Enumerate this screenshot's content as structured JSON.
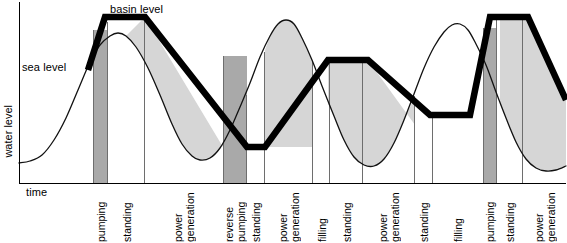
{
  "figure": {
    "title": "",
    "axis": {
      "y_label": "water level",
      "x_label": "time",
      "origin_x": 19,
      "origin_y": 183,
      "right_x": 566,
      "top_y": 2
    },
    "annotations": [
      {
        "name": "sea-level-label",
        "text": "sea level",
        "x": 22,
        "y": 61
      },
      {
        "name": "basin-level-label",
        "text": "basin level",
        "x": 110,
        "y": 4
      }
    ],
    "colors": {
      "basin_line": "#000000",
      "sea_line": "#1a1a1a",
      "fill_light": "#d4d4d4",
      "fill_dark": "#a8a8a8",
      "axis": "#000000",
      "divider": "#6e6e6e",
      "background": "#ffffff"
    },
    "phases": [
      {
        "label": "pumping",
        "x0": 93,
        "x1": 108,
        "shade": "dark"
      },
      {
        "label": "standing",
        "x0": 108,
        "x1": 145,
        "shade": "none"
      },
      {
        "label": "power\ngeneration",
        "x0": 145,
        "x1": 223,
        "shade": "none"
      },
      {
        "label": "reverse\npumping",
        "x0": 223,
        "x1": 247,
        "shade": "dark"
      },
      {
        "label": "standing",
        "x0": 247,
        "x1": 265,
        "shade": "none"
      },
      {
        "label": "power\ngeneration",
        "x0": 265,
        "x1": 313,
        "shade": "none"
      },
      {
        "label": "filling",
        "x0": 313,
        "x1": 330,
        "shade": "none"
      },
      {
        "label": "standing",
        "x0": 330,
        "x1": 363,
        "shade": "none"
      },
      {
        "label": "power\ngeneration",
        "x0": 363,
        "x1": 415,
        "shade": "none"
      },
      {
        "label": "standing",
        "x0": 415,
        "x1": 433,
        "shade": "none"
      },
      {
        "label": "filling",
        "x0": 433,
        "x1": 483,
        "shade": "none"
      },
      {
        "label": "pumping",
        "x0": 483,
        "x1": 497,
        "shade": "dark"
      },
      {
        "label": "standing",
        "x0": 497,
        "x1": 523,
        "shade": "none"
      },
      {
        "label": "power\ngeneration",
        "x0": 523,
        "x1": 566,
        "shade": "none"
      }
    ]
  },
  "chart_data": {
    "type": "line",
    "xlabel": "time",
    "ylabel": "water level",
    "axis_ticks": {
      "x": [],
      "y": []
    },
    "grid": false,
    "legend": [
      "sea level",
      "basin level"
    ],
    "legend_position": "inline-annotation",
    "series": [
      {
        "name": "sea level",
        "style": "thin-curve",
        "points": [
          [
            19,
            163
          ],
          [
            30,
            161
          ],
          [
            42,
            155
          ],
          [
            54,
            140
          ],
          [
            66,
            118
          ],
          [
            78,
            90
          ],
          [
            90,
            62
          ],
          [
            100,
            45
          ],
          [
            110,
            36
          ],
          [
            118,
            33
          ],
          [
            126,
            36
          ],
          [
            136,
            47
          ],
          [
            148,
            68
          ],
          [
            160,
            95
          ],
          [
            172,
            124
          ],
          [
            182,
            144
          ],
          [
            192,
            156
          ],
          [
            200,
            160
          ],
          [
            210,
            158
          ],
          [
            220,
            148
          ],
          [
            230,
            130
          ],
          [
            240,
            107
          ],
          [
            250,
            83
          ],
          [
            260,
            57
          ],
          [
            270,
            36
          ],
          [
            278,
            24
          ],
          [
            286,
            20
          ],
          [
            294,
            24
          ],
          [
            302,
            38
          ],
          [
            312,
            60
          ],
          [
            322,
            86
          ],
          [
            334,
            116
          ],
          [
            344,
            140
          ],
          [
            354,
            157
          ],
          [
            364,
            165
          ],
          [
            374,
            166
          ],
          [
            384,
            159
          ],
          [
            394,
            143
          ],
          [
            404,
            120
          ],
          [
            414,
            94
          ],
          [
            424,
            68
          ],
          [
            434,
            47
          ],
          [
            444,
            32
          ],
          [
            452,
            25
          ],
          [
            460,
            24
          ],
          [
            468,
            30
          ],
          [
            476,
            44
          ],
          [
            486,
            65
          ],
          [
            496,
            92
          ],
          [
            506,
            118
          ],
          [
            516,
            142
          ],
          [
            526,
            159
          ],
          [
            536,
            168
          ],
          [
            546,
            171
          ],
          [
            556,
            170
          ],
          [
            566,
            166
          ]
        ]
      },
      {
        "name": "basin level",
        "style": "thick-line",
        "points": [
          [
            88,
            70
          ],
          [
            105,
            17
          ],
          [
            145,
            17
          ],
          [
            247,
            147
          ],
          [
            265,
            147
          ],
          [
            328,
            60
          ],
          [
            368,
            60
          ],
          [
            430,
            115
          ],
          [
            470,
            115
          ],
          [
            490,
            17
          ],
          [
            528,
            17
          ],
          [
            566,
            100
          ]
        ]
      }
    ],
    "shaded_regions": [
      {
        "name": "energy-area-1",
        "phase": "power generation",
        "shade": "light"
      },
      {
        "name": "energy-area-2",
        "phase": "power generation",
        "shade": "light"
      },
      {
        "name": "energy-area-3",
        "phase": "power generation",
        "shade": "light"
      },
      {
        "name": "energy-area-4",
        "phase": "power generation",
        "shade": "light"
      }
    ]
  }
}
